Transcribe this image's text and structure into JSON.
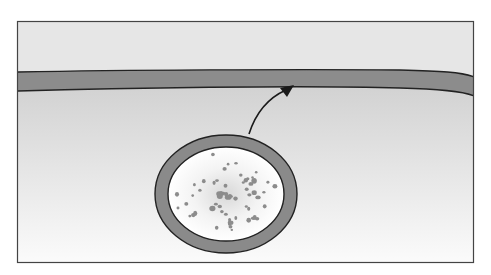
{
  "diagram": {
    "type": "cell-biology-illustration",
    "elements": {
      "extracellular_space": {
        "label": "",
        "color": "#e6e6e6"
      },
      "plasma_membrane": {
        "label": "",
        "fill": "#8c8c8c",
        "stroke": "#222222"
      },
      "cytoplasm": {
        "label": "",
        "gradient_top": "#d2d2d2",
        "gradient_bottom": "#fbfbfb"
      },
      "vesicle": {
        "label": "",
        "membrane_fill": "#8a8a8a",
        "lumen_fill_center": "#dcdcdc",
        "lumen_fill_edge": "#ffffff",
        "stroke": "#222222",
        "center": [
          226,
          194
        ],
        "outer_radius": [
          71,
          59
        ],
        "inner_radius": [
          59,
          47
        ]
      },
      "cargo_particles": {
        "label": "",
        "color": "#8c8c8c",
        "count": 64
      },
      "arrow": {
        "label": "",
        "from": [
          249,
          134
        ],
        "to": [
          293,
          86
        ],
        "color": "#1a1a1a"
      }
    },
    "frame": {
      "x": 17,
      "y": 21,
      "width": 457,
      "height": 242,
      "stroke": "#444444"
    }
  }
}
